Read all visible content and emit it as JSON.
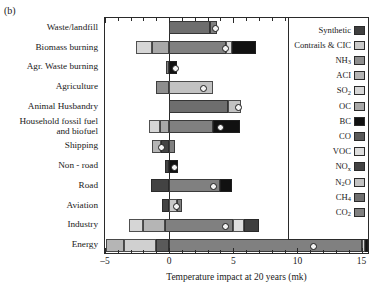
{
  "panel_label": "(b)",
  "chart_data": {
    "type": "bar",
    "orientation": "horizontal",
    "stacked": true,
    "title": "",
    "xlabel": "Temperature impact at 20 years (mk)",
    "ylabel": "",
    "xlim": [
      -5,
      15.5
    ],
    "xticks": [
      -5,
      0,
      5,
      10,
      15
    ],
    "xtick_labels": [
      "–5",
      "0",
      "5",
      "10",
      "15"
    ],
    "minor_tick_step": 1,
    "grid": false,
    "legend_position": "right",
    "categories": [
      "Waste/landfill",
      "Biomass burning",
      "Agr. Waste burning",
      "Agriculture",
      "Animal Husbandry",
      "Household fossil fuel\nand biofuel",
      "Shipping",
      "Non - road",
      "Road",
      "Aviation",
      "Industry",
      "Energy"
    ],
    "legend_entries": [
      {
        "label": "Synthetic",
        "color": "#3f3f3f"
      },
      {
        "label": "Contrails & CIC",
        "color": "#c9c9c9"
      },
      {
        "label": "NH3",
        "color": "#8e8e8e"
      },
      {
        "label": "ACI",
        "color": "#b5b5b5"
      },
      {
        "label": "SO2",
        "color": "#d6d6d6"
      },
      {
        "label": "OC",
        "color": "#a8a8a8"
      },
      {
        "label": "BC",
        "color": "#111111"
      },
      {
        "label": "CO",
        "color": "#5a5a5a"
      },
      {
        "label": "VOC",
        "color": "#dedede"
      },
      {
        "label": "NOx",
        "color": "#434343"
      },
      {
        "label": "N2O",
        "color": "#c2c2c2"
      },
      {
        "label": "CH4",
        "color": "#6e6e6e"
      },
      {
        "label": "CO2",
        "color": "#808080"
      }
    ],
    "series_order": [
      "CO2",
      "CH4",
      "N2O",
      "NOx",
      "VOC",
      "CO",
      "BC",
      "OC",
      "SO2",
      "ACI",
      "NH3",
      "Contrails & CIC",
      "Synthetic"
    ],
    "bars": [
      {
        "category": "Waste/landfill",
        "net": 3.5,
        "segments": [
          {
            "agent": "CH4",
            "start": 0.0,
            "end": 3.2,
            "color": "#6e6e6e"
          },
          {
            "agent": "CO2",
            "start": 3.2,
            "end": 3.7,
            "color": "#808080"
          }
        ]
      },
      {
        "category": "Biomass burning",
        "net": 4.3,
        "segments": [
          {
            "agent": "SO2",
            "start": -2.6,
            "end": -1.3,
            "color": "#d6d6d6"
          },
          {
            "agent": "OC",
            "start": -1.3,
            "end": 0.0,
            "color": "#a8a8a8"
          },
          {
            "agent": "CO2",
            "start": 0.0,
            "end": 4.4,
            "color": "#808080"
          },
          {
            "agent": "VOC",
            "start": 4.4,
            "end": 4.9,
            "color": "#dedede"
          },
          {
            "agent": "BC",
            "start": 4.9,
            "end": 6.8,
            "color": "#111111"
          }
        ]
      },
      {
        "category": "Agr. Waste burning",
        "net": 0.45,
        "segments": [
          {
            "agent": "CO2",
            "start": -0.25,
            "end": 0.0,
            "color": "#808080"
          },
          {
            "agent": "BC",
            "start": 0.0,
            "end": 0.6,
            "color": "#111111"
          }
        ]
      },
      {
        "category": "Agriculture",
        "net": 2.6,
        "segments": [
          {
            "agent": "NH3",
            "start": -1.0,
            "end": 0.0,
            "color": "#8e8e8e"
          },
          {
            "agent": "N2O",
            "start": 0.0,
            "end": 3.4,
            "color": "#c2c2c2"
          }
        ]
      },
      {
        "category": "Animal Husbandry",
        "net": 5.3,
        "segments": [
          {
            "agent": "CH4",
            "start": 0.0,
            "end": 4.6,
            "color": "#6e6e6e"
          },
          {
            "agent": "N2O",
            "start": 4.6,
            "end": 5.6,
            "color": "#c2c2c2"
          }
        ]
      },
      {
        "category": "Household fossil fuel\nand biofuel",
        "net": 3.9,
        "segments": [
          {
            "agent": "SO2",
            "start": -1.6,
            "end": -0.7,
            "color": "#d6d6d6"
          },
          {
            "agent": "OC",
            "start": -0.7,
            "end": 0.0,
            "color": "#a8a8a8"
          },
          {
            "agent": "CO2",
            "start": 0.0,
            "end": 3.4,
            "color": "#808080"
          },
          {
            "agent": "BC",
            "start": 3.4,
            "end": 5.5,
            "color": "#111111"
          }
        ]
      },
      {
        "category": "Shipping",
        "net": -0.7,
        "segments": [
          {
            "agent": "ACI",
            "start": -1.3,
            "end": -0.6,
            "color": "#b5b5b5"
          },
          {
            "agent": "NOx",
            "start": -0.6,
            "end": 0.0,
            "color": "#434343"
          },
          {
            "agent": "CO2",
            "start": 0.0,
            "end": 0.45,
            "color": "#808080"
          }
        ]
      },
      {
        "category": "Non - road",
        "net": 0.35,
        "segments": [
          {
            "agent": "NOx",
            "start": -0.35,
            "end": 0.0,
            "color": "#434343"
          },
          {
            "agent": "BC",
            "start": 0.0,
            "end": 0.7,
            "color": "#111111"
          }
        ]
      },
      {
        "category": "Road",
        "net": 3.4,
        "segments": [
          {
            "agent": "NOx",
            "start": -1.4,
            "end": 0.0,
            "color": "#434343"
          },
          {
            "agent": "CO2",
            "start": 0.0,
            "end": 4.0,
            "color": "#808080"
          },
          {
            "agent": "BC",
            "start": 4.0,
            "end": 4.9,
            "color": "#111111"
          }
        ]
      },
      {
        "category": "Aviation",
        "net": 0.5,
        "segments": [
          {
            "agent": "NOx",
            "start": -0.55,
            "end": 0.0,
            "color": "#434343"
          },
          {
            "agent": "Contrails & CIC",
            "start": 0.0,
            "end": 0.6,
            "color": "#c9c9c9"
          },
          {
            "agent": "CO2",
            "start": 0.6,
            "end": 1.0,
            "color": "#808080"
          }
        ]
      },
      {
        "category": "Industry",
        "net": 4.3,
        "segments": [
          {
            "agent": "SO2",
            "start": -3.1,
            "end": -2.0,
            "color": "#d6d6d6"
          },
          {
            "agent": "ACI",
            "start": -2.0,
            "end": -0.3,
            "color": "#b5b5b5"
          },
          {
            "agent": "CO2",
            "start": -0.3,
            "end": 5.0,
            "color": "#808080"
          },
          {
            "agent": "VOC",
            "start": 5.0,
            "end": 5.8,
            "color": "#dedede"
          },
          {
            "agent": "BC",
            "start": 5.8,
            "end": 7.0,
            "color": "#3f3f3f"
          }
        ]
      },
      {
        "category": "Energy",
        "net": 11.2,
        "segments": [
          {
            "agent": "SO2",
            "start": -4.9,
            "end": -3.5,
            "color": "#b5b5b5"
          },
          {
            "agent": "ACI",
            "start": -3.5,
            "end": -1.0,
            "color": "#d0d0d0"
          },
          {
            "agent": "NOx",
            "start": -1.0,
            "end": 0.0,
            "color": "#5a5a5a"
          },
          {
            "agent": "CO2",
            "start": 0.0,
            "end": 15.0,
            "color": "#808080"
          },
          {
            "agent": "CH4",
            "start": 15.0,
            "end": 15.3,
            "color": "#d6d6d6"
          },
          {
            "agent": "BC",
            "start": 15.3,
            "end": 15.5,
            "color": "#111111"
          }
        ]
      }
    ]
  }
}
